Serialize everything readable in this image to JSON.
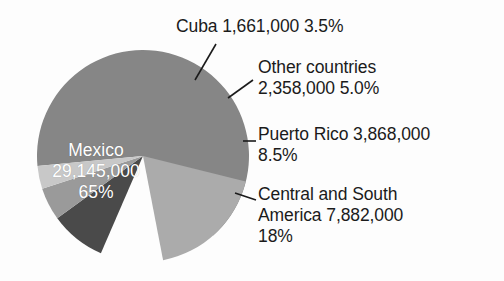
{
  "chart_data": {
    "type": "pie",
    "title": "",
    "subtitle": "",
    "xlabel": "",
    "ylabel": "",
    "legend_position": "callouts",
    "grid": false,
    "total_label": "",
    "categories": [
      "Mexico",
      "Central and South America",
      "Puerto Rico",
      "Other countries",
      "Cuba"
    ],
    "values": [
      29145000,
      7882000,
      3868000,
      2358000,
      1661000
    ],
    "percent": [
      65,
      18,
      8.5,
      5.0,
      3.5
    ],
    "value_labels": [
      "29,145,000",
      "7,882,000",
      "3,868,000",
      "2,358,000",
      "1,661,000"
    ],
    "percent_labels": [
      "65%",
      "18%",
      "8.5%",
      "5.0%",
      "3.5%"
    ],
    "colors": [
      "#868686",
      "#ababab",
      "#4a4a4a",
      "#9a9a9a",
      "#c8c8c8"
    ],
    "slices": [
      {
        "name": "Mexico",
        "value": 29145000,
        "value_label": "29,145,000",
        "percent": 65,
        "percent_label": "65%",
        "color": "#868686",
        "label_placement": "inside",
        "label_text": "Mexico\n29,145,000\n65%"
      },
      {
        "name": "Central and South America",
        "value": 7882000,
        "value_label": "7,882,000",
        "percent": 18,
        "percent_label": "18%",
        "color": "#ababab",
        "label_placement": "callout",
        "label_text": "Central and South\nAmerica  7,882,000\n18%"
      },
      {
        "name": "Puerto Rico",
        "value": 3868000,
        "value_label": "3,868,000",
        "percent": 8.5,
        "percent_label": "8.5%",
        "color": "#4a4a4a",
        "label_placement": "callout",
        "label_text": "Puerto Rico  3,868,000\n8.5%"
      },
      {
        "name": "Other countries",
        "value": 2358000,
        "value_label": "2,358,000",
        "percent": 5.0,
        "percent_label": "5.0%",
        "color": "#9a9a9a",
        "label_placement": "callout",
        "label_text": "Other countries\n2,358,000  5.0%"
      },
      {
        "name": "Cuba",
        "value": 1661000,
        "value_label": "1,661,000",
        "percent": 3.5,
        "percent_label": "3.5%",
        "color": "#c8c8c8",
        "label_placement": "callout",
        "label_text": "Cuba  1,661,000  3.5%"
      }
    ]
  },
  "callouts": {
    "cuba": "Cuba  1,661,000  3.5%",
    "other": "Other countries\n2,358,000  5.0%",
    "puerto_rico": "Puerto Rico  3,868,000\n8.5%",
    "central_south": "Central and South\nAmerica  7,882,000\n18%"
  },
  "slice_labels": {
    "mexico": "Mexico\n29,145,000\n65%"
  }
}
